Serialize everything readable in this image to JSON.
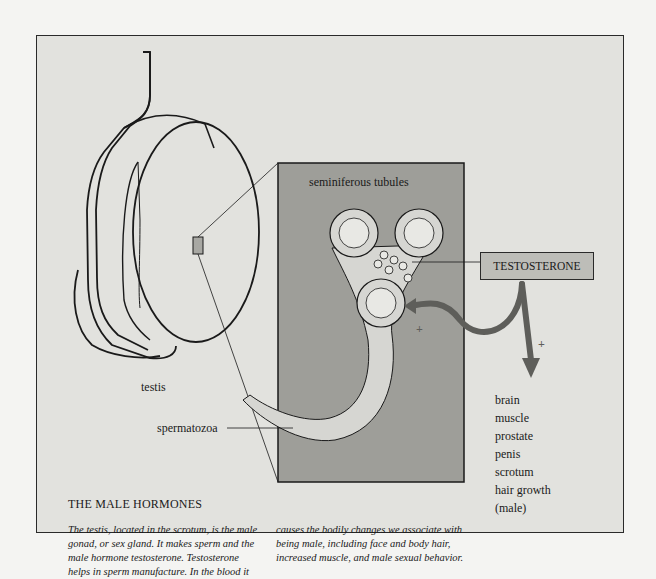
{
  "diagram": {
    "labels": {
      "testis": "testis",
      "tubules": "seminiferous tubules",
      "cells": "cells",
      "spermatozoa": "spermatozoa",
      "hormone": "TESTOSTERONE",
      "plus": "+"
    },
    "target_organs": [
      "brain",
      "muscle",
      "prostate",
      "penis",
      "scrotum",
      "hair growth",
      "(male)"
    ],
    "caption": {
      "title": "THE MALE HORMONES",
      "left": "The testis, located in the scrotum, is the male gonad, or sex gland. It makes sperm and the male hormone testosterone. Testosterone helps in sperm manufacture. In the blood it",
      "right": "causes the bodily changes we associate with being male, including face and body hair, increased muscle, and male sexual behavior."
    },
    "colors": {
      "page_bg": "#f4f4f2",
      "frame_bg": "#e2e2de",
      "panel_bg": "#9e9e99",
      "tubule_fill": "#d6d6d2",
      "arrow": "#5e5e5a",
      "box_fill": "#bdbdb8",
      "ink": "#1a1a1a"
    }
  }
}
